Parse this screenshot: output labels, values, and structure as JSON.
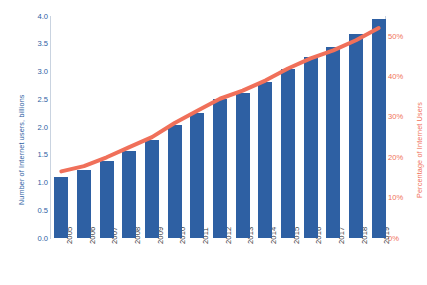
{
  "chart_data": {
    "type": "bar",
    "title": "",
    "subtitle": "",
    "xlabel": "",
    "ylabel": "Number of Internet users, billions",
    "y2label": "Percentage of Internet Users",
    "categories": [
      "2005",
      "2006",
      "2007",
      "2008",
      "2009",
      "2010",
      "2011",
      "2012",
      "2013",
      "2014",
      "2015",
      "2016",
      "2017",
      "2018",
      "2019"
    ],
    "ylim": [
      0.0,
      4.0
    ],
    "y2lim": [
      0,
      55
    ],
    "yticks": [
      "0.0",
      "0.5",
      "1.0",
      "1.5",
      "2.0",
      "2.5",
      "3.0",
      "3.5",
      "4.0"
    ],
    "ytick_values": [
      0.0,
      0.5,
      1.0,
      1.5,
      2.0,
      2.5,
      3.0,
      3.5,
      4.0
    ],
    "y2ticks": [
      "0%",
      "10%",
      "20%",
      "30%",
      "40%",
      "50%"
    ],
    "y2tick_values": [
      0,
      10,
      20,
      30,
      40,
      50
    ],
    "grid": false,
    "legend": "none",
    "series": [
      {
        "name": "Number of Internet users, billions",
        "kind": "bar",
        "axis": "left",
        "color": "#2e60a3",
        "values": [
          1.1,
          1.22,
          1.39,
          1.57,
          1.77,
          2.03,
          2.25,
          2.5,
          2.62,
          2.82,
          3.05,
          3.27,
          3.45,
          3.67,
          3.95
        ]
      },
      {
        "name": "Percentage of Internet Users",
        "kind": "line",
        "axis": "right",
        "color": "#f0705a",
        "values": [
          16.5,
          17.8,
          20.0,
          22.5,
          25.0,
          28.5,
          31.5,
          34.5,
          36.5,
          39.0,
          42.0,
          44.5,
          46.5,
          49.0,
          52.0
        ]
      }
    ]
  },
  "colors": {
    "bar": "#2e60a3",
    "line": "#f0705a",
    "axis": "#c9d3e0",
    "xtick_text": "#3b3b3b",
    "background": "#ffffff"
  }
}
